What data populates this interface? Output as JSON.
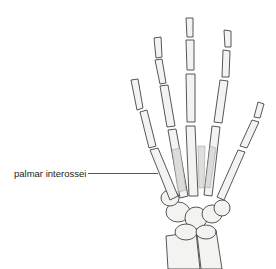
{
  "figure": {
    "labels": [
      {
        "text": "palmar interossei",
        "target": "muscles between metacarpals"
      }
    ]
  },
  "colors": {
    "bone_fill": "#f3f3f1",
    "bone_stroke": "#444444",
    "muscle_fill": "#d9d9d6",
    "leader_line": "#555555"
  }
}
